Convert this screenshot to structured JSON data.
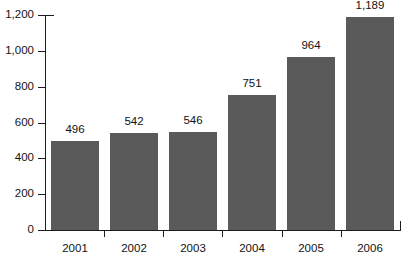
{
  "chart_data": {
    "type": "bar",
    "title": "",
    "subtitle": "",
    "xlabel": "",
    "ylabel": "",
    "categories": [
      "2001",
      "2002",
      "2003",
      "2004",
      "2005",
      "2006"
    ],
    "values": [
      496,
      542,
      546,
      751,
      964,
      1189
    ],
    "value_labels": [
      "496",
      "542",
      "546",
      "751",
      "964",
      "1,189"
    ],
    "ylim": [
      0,
      1200
    ],
    "yticks": [
      0,
      200,
      400,
      600,
      800,
      1000,
      1200
    ],
    "ytick_labels": [
      "0",
      "200",
      "400",
      "600",
      "800",
      "1,000",
      "1,200"
    ],
    "grid": false,
    "legend": null,
    "legend_position": "none",
    "series": [
      {
        "name": "",
        "values": [
          496,
          542,
          546,
          751,
          964,
          1189
        ]
      }
    ],
    "colors": {
      "bar_fill": "#5a5a5a",
      "axis": "#1c1c1c",
      "text": "#121212",
      "background": "#ffffff"
    }
  }
}
